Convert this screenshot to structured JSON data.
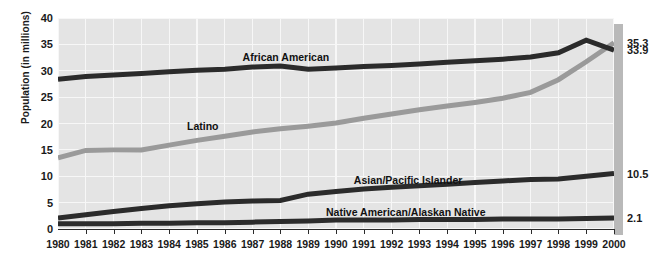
{
  "chart_data": {
    "type": "line",
    "title": "",
    "xlabel": "",
    "ylabel": "Population (in millions)",
    "ylim": [
      0,
      40
    ],
    "yticks": [
      0,
      5,
      10,
      15,
      20,
      25,
      30,
      35,
      40
    ],
    "grid": true,
    "legend_position": "inline-labels",
    "categories": [
      "1980",
      "1981",
      "1982",
      "1983",
      "1984",
      "1985",
      "1986",
      "1987",
      "1988",
      "1989",
      "1990",
      "1991",
      "1992",
      "1993",
      "1994",
      "1995",
      "1996",
      "1997",
      "1998",
      "1999",
      "2000"
    ],
    "series": [
      {
        "name": "African American",
        "color": "#2b2b2b",
        "end_value_label": "33.9",
        "label_x_year": "1987",
        "values": [
          28.4,
          28.9,
          29.2,
          29.5,
          29.8,
          30.1,
          30.3,
          30.7,
          30.9,
          30.3,
          30.5,
          30.8,
          31.0,
          31.3,
          31.6,
          31.9,
          32.2,
          32.6,
          33.4,
          35.8,
          33.9
        ]
      },
      {
        "name": "Latino",
        "color": "#9a9a9a",
        "end_value_label": "35.3",
        "label_x_year": "1985",
        "values": [
          13.5,
          14.9,
          15.0,
          15.0,
          15.9,
          16.8,
          17.6,
          18.4,
          19.0,
          19.5,
          20.1,
          21.0,
          21.8,
          22.6,
          23.3,
          24.0,
          24.8,
          25.9,
          28.3,
          31.7,
          35.3
        ]
      },
      {
        "name": "Asian/Pacific Islander",
        "color": "#2b2b2b",
        "end_value_label": "10.5",
        "label_x_year": "1991",
        "values": [
          2.1,
          2.7,
          3.3,
          3.9,
          4.4,
          4.8,
          5.1,
          5.3,
          5.4,
          6.6,
          7.1,
          7.6,
          7.9,
          8.2,
          8.5,
          8.8,
          9.1,
          9.4,
          9.5,
          10.0,
          10.5
        ]
      },
      {
        "name": "Native American/Alaskan Native",
        "color": "#2b2b2b",
        "end_value_label": "2.1",
        "label_x_year": "1990",
        "values": [
          1.0,
          1.0,
          1.0,
          1.1,
          1.1,
          1.2,
          1.2,
          1.3,
          1.4,
          1.5,
          1.7,
          1.7,
          1.7,
          1.8,
          1.8,
          1.8,
          1.9,
          1.9,
          1.9,
          2.0,
          2.1
        ]
      }
    ],
    "end_labels": [
      {
        "text": "35.3",
        "value": 35.3
      },
      {
        "text": "33.9",
        "value": 33.9
      },
      {
        "text": "10.5",
        "value": 10.5
      },
      {
        "text": "2.1",
        "value": 2.1
      }
    ],
    "colors": {
      "panel_background": "#e4e4e4",
      "gridline": "#f7f7f7",
      "dark_series": "#2b2b2b",
      "gray_series": "#9a9a9a",
      "panel_shadow": "#b9b9b9",
      "text": "#1a1a1a"
    }
  }
}
